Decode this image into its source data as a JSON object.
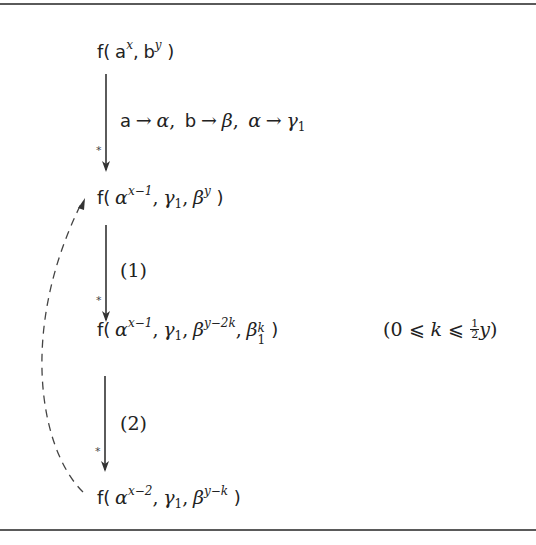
{
  "diagram": {
    "type": "rewriting-derivation",
    "nodes": [
      {
        "id": "n1",
        "text": "f( a^x, b^y )"
      },
      {
        "id": "n2",
        "text": "f( α^(x−1), γ1, β^y )"
      },
      {
        "id": "n3",
        "text": "f( α^(x−1), γ1, β^(y−2k), β1^k )",
        "constraint": "(0 ⩽ k ⩽ ½y)"
      },
      {
        "id": "n4",
        "text": "f( α^(x−2), γ1, β^(y−k) )"
      }
    ],
    "edges": [
      {
        "from": "n1",
        "to": "n2",
        "style": "solid",
        "star": "*",
        "label": "a → α, b → β, α → γ1"
      },
      {
        "from": "n2",
        "to": "n3",
        "style": "solid",
        "star": "*",
        "label": "(1)"
      },
      {
        "from": "n3",
        "to": "n4",
        "style": "solid",
        "star": "*",
        "label": "(2)"
      },
      {
        "from": "n4",
        "to": "n2",
        "style": "dashed",
        "label": ""
      }
    ]
  },
  "text": {
    "f_open": "f(",
    "close": " )",
    "comma": ",",
    "a": "a",
    "b": "b",
    "x": "x",
    "y": "y",
    "alpha": "α",
    "beta": "β",
    "gamma": "γ",
    "one": "1",
    "k": "k",
    "x_minus_1": "x−1",
    "x_minus_2": "x−2",
    "y_minus_2k": "y−2k",
    "y_minus_k": "y−k",
    "arrow": "→",
    "star": "*",
    "label_1": "(1)",
    "label_2": "(2)",
    "constraint_open": "(0 ⩽ ",
    "constraint_le": " ⩽ ",
    "frac_num": "1",
    "frac_den": "2",
    "constraint_close": ")"
  }
}
